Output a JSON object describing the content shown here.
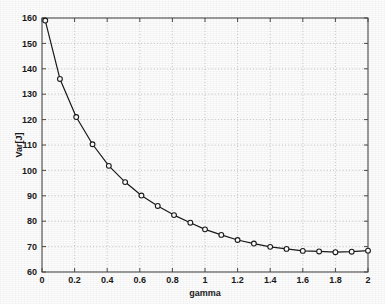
{
  "chart_data": {
    "type": "line",
    "title": "",
    "subtitle": "",
    "xlabel": "gamma",
    "ylabel": "Var[J]",
    "xlim": [
      0,
      2
    ],
    "ylim": [
      60,
      160
    ],
    "grid": true,
    "legend": null,
    "marker": "circle",
    "line_color": "#1a1a1a",
    "grid_color": "#b8b8b8",
    "axis_color": "#4a4a4a",
    "xticks": [
      0,
      0.2,
      0.4,
      0.6,
      0.8,
      1,
      1.2,
      1.4,
      1.6,
      1.8,
      2
    ],
    "xticklabels": [
      "0",
      "0.2",
      "0.4",
      "0.6",
      "0.8",
      "1",
      "1.2",
      "1.4",
      "1.6",
      "1.8",
      "2"
    ],
    "yticks": [
      60,
      70,
      80,
      90,
      100,
      110,
      120,
      130,
      140,
      150,
      160
    ],
    "yticklabels": [
      "60",
      "70",
      "80",
      "90",
      "100",
      "110",
      "120",
      "130",
      "140",
      "150",
      "160"
    ],
    "series": [
      {
        "name": "Var[J] vs gamma",
        "x": [
          0.02,
          0.11,
          0.21,
          0.31,
          0.41,
          0.51,
          0.61,
          0.71,
          0.81,
          0.91,
          1.0,
          1.1,
          1.2,
          1.3,
          1.4,
          1.5,
          1.6,
          1.7,
          1.8,
          1.9,
          2.0
        ],
        "y": [
          159.0,
          136.0,
          121.0,
          110.3,
          101.8,
          95.4,
          90.1,
          86.0,
          82.4,
          79.4,
          76.8,
          74.6,
          72.6,
          71.2,
          69.9,
          69.1,
          68.3,
          68.1,
          67.8,
          68.0,
          68.4
        ]
      }
    ]
  }
}
